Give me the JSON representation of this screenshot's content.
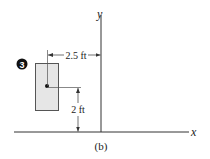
{
  "figure": {
    "caption": "(b)",
    "axes": {
      "x_label": "x",
      "y_label": "y"
    },
    "step_badge": "3",
    "dimensions": {
      "horizontal": "2.5 ft",
      "vertical": "2 ft"
    },
    "colors": {
      "line": "#333333",
      "rect_fill": "#e6e6e6",
      "rect_stroke": "#555555",
      "badge_fill": "#111111",
      "badge_text": "#ffffff"
    }
  }
}
